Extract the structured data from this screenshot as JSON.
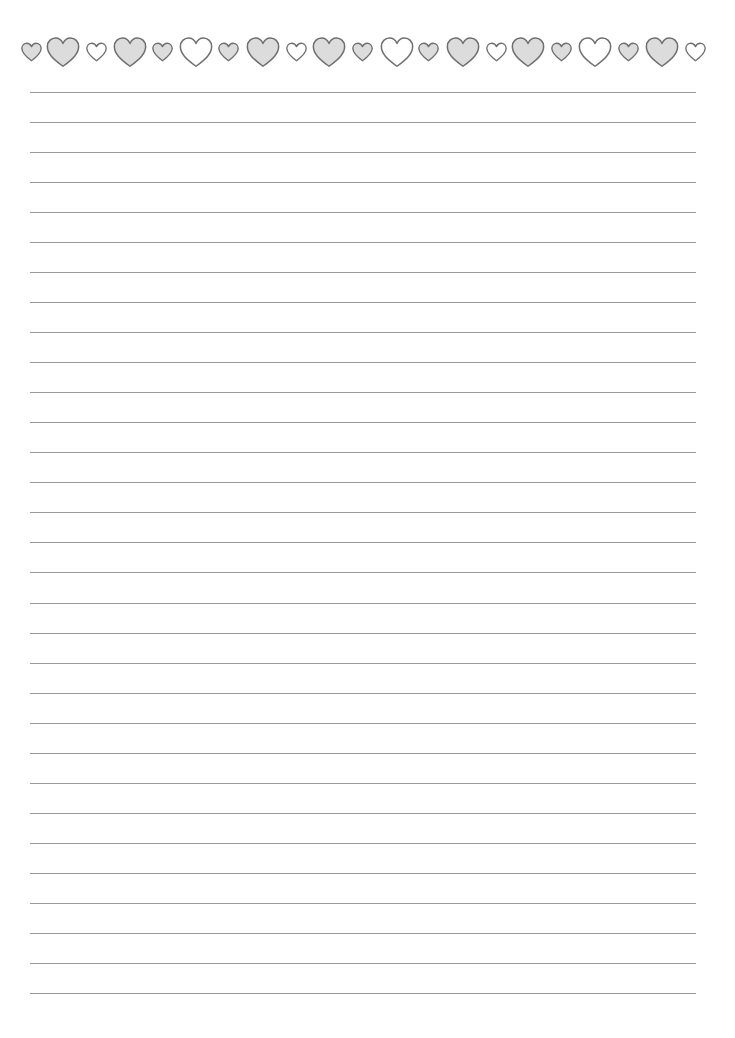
{
  "page": {
    "type": "lined-writing-paper",
    "background": "#ffffff"
  },
  "border": {
    "motif": "heart-icon",
    "center_y": 52,
    "stroke_color": "#707070",
    "filled_color": "#dcdcdc",
    "empty_color": "#ffffff",
    "sizes": {
      "large": 34,
      "small": 21
    },
    "hearts": [
      {
        "cx": 31,
        "size": "small",
        "fill": "gray"
      },
      {
        "cx": 63,
        "size": "large",
        "fill": "gray"
      },
      {
        "cx": 96,
        "size": "small",
        "fill": "white"
      },
      {
        "cx": 130,
        "size": "large",
        "fill": "gray"
      },
      {
        "cx": 162,
        "size": "small",
        "fill": "gray"
      },
      {
        "cx": 196,
        "size": "large",
        "fill": "white"
      },
      {
        "cx": 228,
        "size": "small",
        "fill": "gray"
      },
      {
        "cx": 263,
        "size": "large",
        "fill": "gray"
      },
      {
        "cx": 296,
        "size": "small",
        "fill": "white"
      },
      {
        "cx": 329,
        "size": "large",
        "fill": "gray"
      },
      {
        "cx": 362,
        "size": "small",
        "fill": "gray"
      },
      {
        "cx": 397,
        "size": "large",
        "fill": "white"
      },
      {
        "cx": 428,
        "size": "small",
        "fill": "gray"
      },
      {
        "cx": 463,
        "size": "large",
        "fill": "gray"
      },
      {
        "cx": 496,
        "size": "small",
        "fill": "white"
      },
      {
        "cx": 528,
        "size": "large",
        "fill": "gray"
      },
      {
        "cx": 561,
        "size": "small",
        "fill": "gray"
      },
      {
        "cx": 595,
        "size": "large",
        "fill": "white"
      },
      {
        "cx": 628,
        "size": "small",
        "fill": "gray"
      },
      {
        "cx": 662,
        "size": "large",
        "fill": "gray"
      },
      {
        "cx": 695,
        "size": "small",
        "fill": "white"
      }
    ]
  },
  "ruled_lines": {
    "count": 31,
    "first_y": 92,
    "spacing": 30.03,
    "left_x": 30,
    "right_x": 696,
    "color": "#9a9a9a",
    "thickness": 1
  }
}
